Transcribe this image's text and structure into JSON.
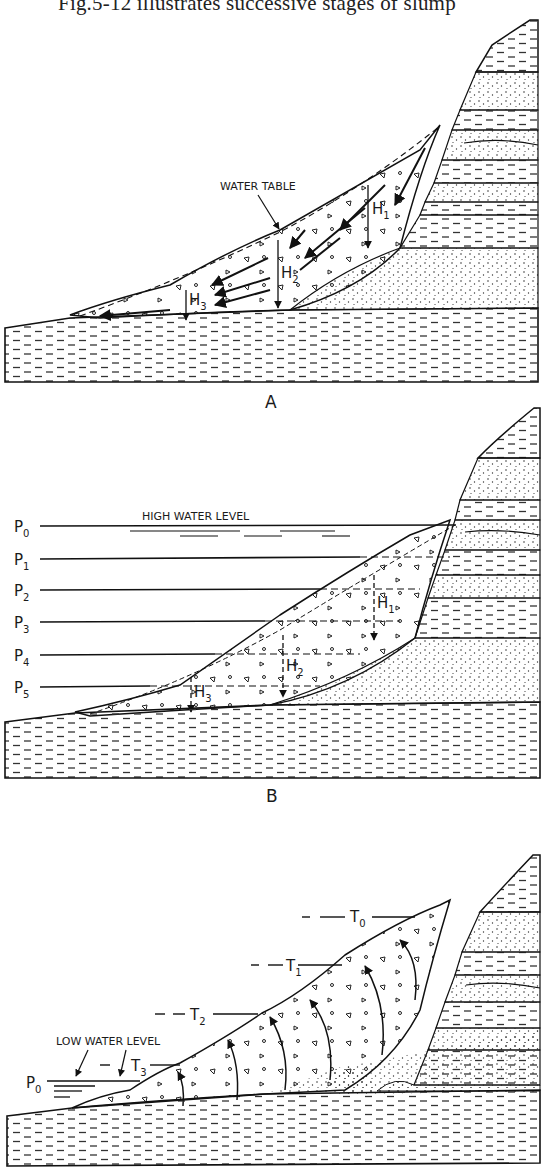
{
  "page": {
    "text_line": "Fig.5-12 illustrates successive stages of slump"
  },
  "figure": {
    "panels": [
      {
        "id": "A",
        "label": "A",
        "annotations": {
          "water_table": "WATER TABLE",
          "heights": [
            "H",
            "H",
            "H"
          ],
          "height_subscripts": [
            "1",
            "2",
            "3"
          ]
        }
      },
      {
        "id": "B",
        "label": "B",
        "annotations": {
          "high_water_level": "HIGH WATER LEVEL",
          "levels": [
            "P",
            "P",
            "P",
            "P",
            "P",
            "P"
          ],
          "level_subscripts": [
            "0",
            "1",
            "2",
            "3",
            "4",
            "5"
          ],
          "heights": [
            "H",
            "H",
            "H"
          ],
          "height_subscripts": [
            "1",
            "2",
            "3"
          ]
        }
      },
      {
        "id": "C",
        "label": "C",
        "annotations": {
          "low_water_level": "LOW WATER LEVEL",
          "water_level_label": "P",
          "water_level_subscript": "0",
          "terraces": [
            "T",
            "T",
            "T",
            "T"
          ],
          "terrace_subscripts": [
            "0",
            "1",
            "2",
            "3"
          ]
        }
      }
    ]
  }
}
